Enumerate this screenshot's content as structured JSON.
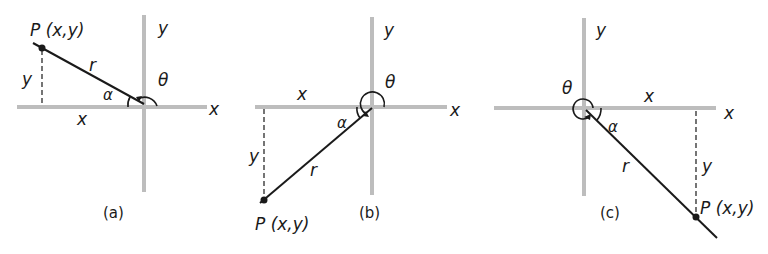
{
  "figure": {
    "colors": {
      "axis": "#bdbdbd",
      "ink": "#1a1a1a",
      "background": "#ffffff"
    },
    "panels": [
      {
        "caption": "(a)",
        "quadrant": "II",
        "point_label": "P (x,y)",
        "x_axis_label": "x",
        "y_axis_label": "y",
        "segment_x_label": "x",
        "segment_y_label": "y",
        "radius_label": "r",
        "alpha_label": "α",
        "theta_label": "θ"
      },
      {
        "caption": "(b)",
        "quadrant": "III",
        "point_label": "P (x,y)",
        "x_axis_label": "x",
        "y_axis_label": "y",
        "segment_x_label": "x",
        "segment_y_label": "y",
        "radius_label": "r",
        "alpha_label": "α",
        "theta_label": "θ"
      },
      {
        "caption": "(c)",
        "quadrant": "IV",
        "point_label": "P (x,y)",
        "x_axis_label": "x",
        "y_axis_label": "y",
        "segment_x_label": "x",
        "segment_y_label": "y",
        "radius_label": "r",
        "alpha_label": "α",
        "theta_label": "θ"
      }
    ]
  }
}
